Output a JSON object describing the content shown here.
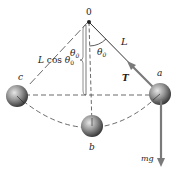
{
  "diagram": {
    "labels": {
      "pivot": "0",
      "length": "L",
      "length_cos": "L cos θ",
      "length_cos_sub": "0",
      "angle": "θ",
      "angle_sub": "0",
      "angle_left": "θ",
      "angle_left_sub": "0",
      "tension": "T",
      "point_a": "a",
      "point_b": "b",
      "point_c": "c",
      "weight": "mg"
    },
    "colors": {
      "line": "#333333",
      "dashed": "#444444",
      "arrow": "#7a7a7a",
      "ball_light": "#d8d8d8",
      "ball_dark": "#3a3a3a"
    }
  }
}
